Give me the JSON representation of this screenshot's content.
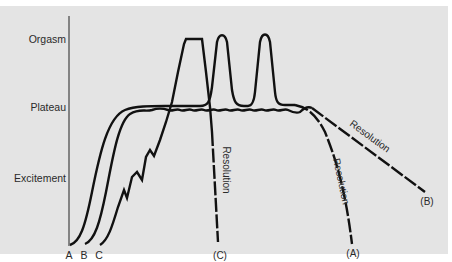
{
  "diagram": {
    "y_axis_levels": [
      {
        "label": "Orgasm"
      },
      {
        "label": "Plateau"
      },
      {
        "label": "Excitement"
      }
    ],
    "start_labels": [
      "A",
      "B",
      "C"
    ],
    "curves": [
      {
        "id": "A",
        "description": "Rises through excitement to plateau, two orgasm peaks, then resolution",
        "resolution_label": "Resolution",
        "end_label": "(A)"
      },
      {
        "id": "B",
        "description": "Rises to plateau, remains on wavy plateau without orgasm, slow resolution",
        "resolution_label": "Resolution",
        "end_label": "(B)"
      },
      {
        "id": "C",
        "description": "Jagged excitement rising rapidly to a single sustained orgasm, rapid resolution",
        "resolution_label": "Resolution",
        "end_label": "(C)"
      }
    ],
    "colors": {
      "background": "#e4e4e4",
      "line": "#111111",
      "text": "#2a2a2a"
    }
  }
}
